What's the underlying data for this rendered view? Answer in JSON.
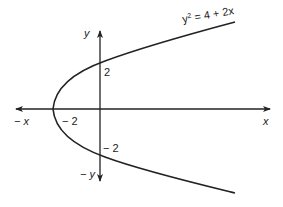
{
  "diagram": {
    "equation_label": {
      "base": "y",
      "sup": "2",
      "rest": " = 4 + 2x"
    },
    "axes": {
      "x_pos_label": "x",
      "x_neg_label": "− x",
      "y_pos_label": "y",
      "y_neg_label": "− y"
    },
    "tick_labels": {
      "y_intercept_pos": "2",
      "y_intercept_neg": "− 2",
      "x_vertex": "− 2"
    },
    "colors": {
      "stroke": "#222222",
      "background": "#ffffff"
    }
  }
}
